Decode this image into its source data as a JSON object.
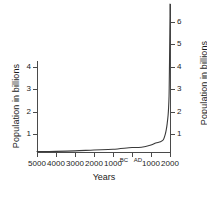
{
  "chart_data": {
    "type": "line",
    "title": "",
    "xlabel": "Years",
    "ylabel": "Population in billions",
    "ylabel_right": "Population in billions",
    "x_tick_labels": [
      "5000",
      "4000",
      "3000",
      "2000",
      "1000",
      "BC",
      "AD",
      "1000",
      "2000"
    ],
    "y_tick_labels_left": [
      "4",
      "3",
      "2",
      "1"
    ],
    "y_tick_labels_right": [
      "6",
      "5",
      "4",
      "3",
      "2",
      "1"
    ],
    "ylim": [
      0,
      6.8
    ],
    "xlim": [
      -5000,
      2000
    ],
    "grid": false,
    "legend": false,
    "line_color": "#3a3a3a",
    "axis_color": "#4a4a4a",
    "series": [
      {
        "name": "World population",
        "x": [
          -5000,
          -4000,
          -3000,
          -2000,
          -1000,
          0,
          500,
          1000,
          1250,
          1500,
          1650,
          1750,
          1804,
          1850,
          1900,
          1927,
          1950,
          1960,
          1974,
          1987,
          1999,
          2000
        ],
        "values": [
          0.02,
          0.03,
          0.05,
          0.09,
          0.12,
          0.2,
          0.21,
          0.31,
          0.4,
          0.46,
          0.55,
          0.79,
          1.0,
          1.26,
          1.65,
          2.0,
          2.5,
          3.0,
          4.0,
          5.0,
          6.0,
          6.1
        ]
      }
    ]
  },
  "axes": {
    "left_ticks": [
      {
        "label": "4",
        "y": 67
      },
      {
        "label": "3",
        "y": 89
      },
      {
        "label": "2",
        "y": 112
      },
      {
        "label": "1",
        "y": 134
      }
    ],
    "right_ticks": [
      {
        "label": "6",
        "y": 22
      },
      {
        "label": "5",
        "y": 44
      },
      {
        "label": "4",
        "y": 67
      },
      {
        "label": "3",
        "y": 89
      },
      {
        "label": "2",
        "y": 112
      },
      {
        "label": "1",
        "y": 134
      }
    ],
    "x_ticks": [
      {
        "label": "5000",
        "x": 37,
        "era": false
      },
      {
        "label": "4000",
        "x": 56,
        "era": false
      },
      {
        "label": "3000",
        "x": 75,
        "era": false
      },
      {
        "label": "2000",
        "x": 94,
        "era": false
      },
      {
        "label": "1000",
        "x": 113,
        "era": false
      },
      {
        "label": "BC",
        "x": 124,
        "era": true,
        "noTick": true
      },
      {
        "label": "AD",
        "x": 138,
        "era": true,
        "noTick": true
      },
      {
        "label": "",
        "x": 132,
        "era": false,
        "labelHidden": true
      },
      {
        "label": "1000",
        "x": 151,
        "era": false
      },
      {
        "label": "2000",
        "x": 170,
        "era": false
      }
    ]
  }
}
